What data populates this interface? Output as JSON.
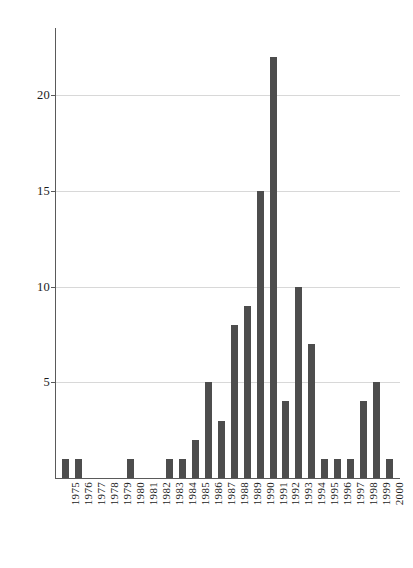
{
  "chart_data": {
    "type": "bar",
    "title": "",
    "subtitle": "",
    "xlabel": "",
    "ylabel": "",
    "categories": [
      "1975",
      "1976",
      "1977",
      "1978",
      "1979",
      "1980",
      "1981",
      "1982",
      "1983",
      "1984",
      "1985",
      "1986",
      "1987",
      "1988",
      "1989",
      "1990",
      "1991",
      "1992",
      "1993",
      "1994",
      "1995",
      "1996",
      "1997",
      "1998",
      "1999",
      "2000"
    ],
    "values": [
      1,
      1,
      0,
      0,
      0,
      1,
      0,
      0,
      1,
      1,
      2,
      5,
      3,
      8,
      9,
      15,
      22,
      4,
      10,
      7,
      1,
      1,
      1,
      4,
      5,
      1
    ],
    "ylim": [
      0,
      23
    ],
    "y_ticks": [
      5,
      10,
      15,
      20
    ],
    "y_tick_labels": [
      "5",
      "10",
      "15",
      "20"
    ],
    "grid": true,
    "grid_axis": "y",
    "legend": null,
    "legend_position": "none",
    "bar_color": "#4d4d4d",
    "grid_color": "#d8d8d8",
    "axis_color": "#5a5a5a",
    "background_color": "#ffffff",
    "x_tick_rotation": -90,
    "annotations": []
  }
}
